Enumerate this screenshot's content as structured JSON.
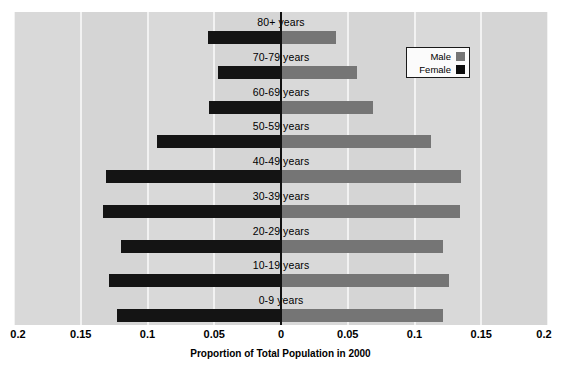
{
  "chart_data": {
    "type": "bar",
    "orientation": "horizontal",
    "subtype": "population-pyramid",
    "title": "",
    "xlabel": "Proportion of Total Population in 2000",
    "ylabel": "",
    "xlim": [
      -0.2,
      0.2
    ],
    "xticks": [
      -0.2,
      -0.15,
      -0.1,
      -0.05,
      0,
      0.05,
      0.1,
      0.15,
      0.2
    ],
    "xticklabels": [
      "0.2",
      "0.15",
      "0.1",
      "0.05",
      "0",
      "0.05",
      "0.1",
      "0.15",
      "0.2"
    ],
    "grid": true,
    "categories": [
      "80+ years",
      "70-79 years",
      "60-69 years",
      "50-59 years",
      "40-49 years",
      "30-39 years",
      "20-29 years",
      "10-19 years",
      "0-9 years"
    ],
    "series": [
      {
        "name": "Female",
        "color": "#141414",
        "direction": "left",
        "values": [
          0.055,
          0.047,
          0.054,
          0.093,
          0.131,
          0.133,
          0.12,
          0.129,
          0.123
        ]
      },
      {
        "name": "Male",
        "color": "#757575",
        "direction": "right",
        "values": [
          0.041,
          0.057,
          0.069,
          0.112,
          0.135,
          0.134,
          0.121,
          0.126,
          0.121
        ]
      }
    ],
    "legend": {
      "position": "upper-right",
      "entries": [
        {
          "label": "Male",
          "color": "#757575"
        },
        {
          "label": "Female",
          "color": "#0d0d0d"
        }
      ]
    },
    "colors": {
      "plot_background": "#d5d5d5",
      "band_background": "#d9d9d9",
      "gridline": "#f2f2f2",
      "zero_axis": "#111111",
      "page_background": "#ffffff"
    }
  }
}
